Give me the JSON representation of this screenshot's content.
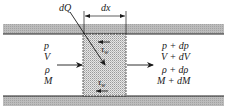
{
  "diagram": {
    "type": "control-volume-duct-flow",
    "labels": {
      "heat": "dQ",
      "length": "dx",
      "wall_shear_top": "τ",
      "wall_shear_top_sub": "w",
      "wall_shear_bottom": "τ",
      "wall_shear_bottom_sub": "w"
    },
    "inlet": [
      "p",
      "V",
      "ρ",
      "M"
    ],
    "outlet": [
      "p + dp",
      "V + dV",
      "ρ + dρ",
      "M + dM"
    ],
    "colors": {
      "wall_fill": "#b5b5b5",
      "wall_edge": "#222222",
      "cv_fill": "#d9d9d9",
      "ink": "#1a1a1a"
    }
  }
}
